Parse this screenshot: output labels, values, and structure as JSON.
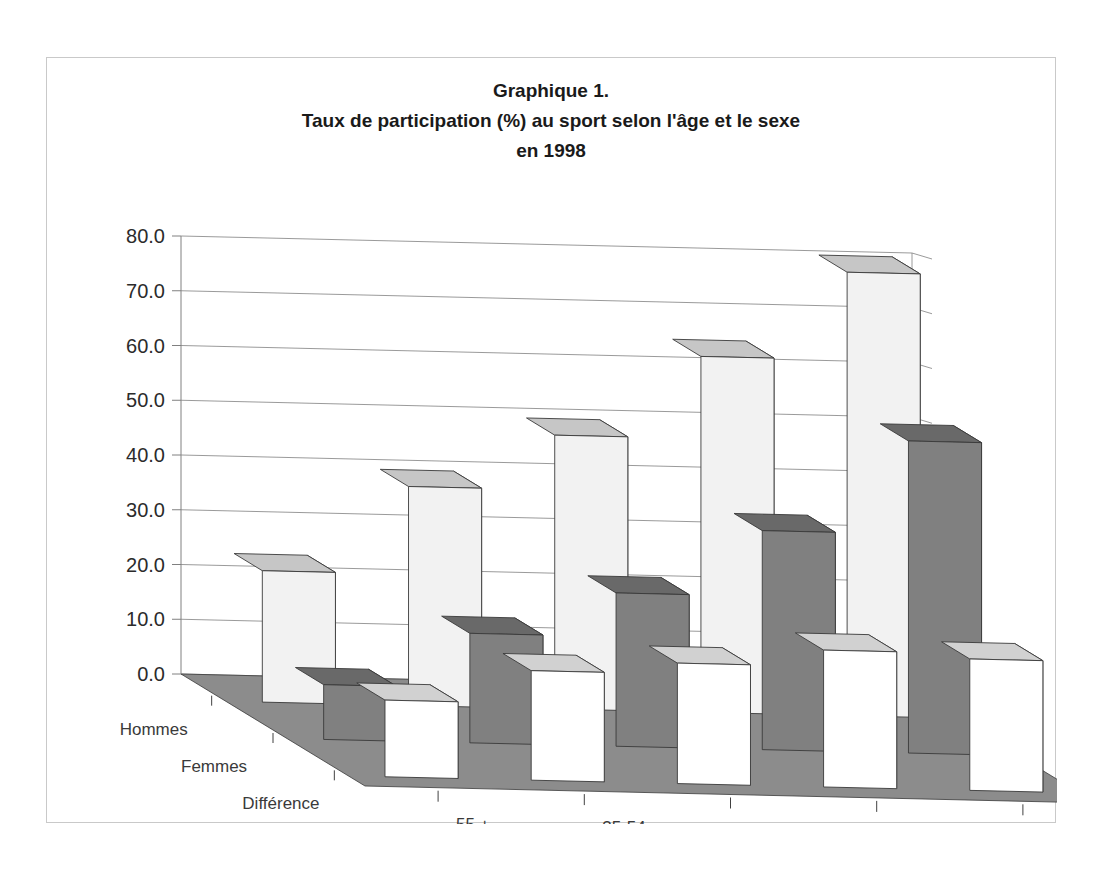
{
  "title": {
    "line1": "Graphique 1.",
    "line2": "Taux de participation (%) au sport selon l'âge et le sexe",
    "line3": "en 1998"
  },
  "colors": {
    "hommes": "#f2f2f2",
    "femmes": "#808080",
    "difference": "#ffffff",
    "floor": "#8c8c8c",
    "side_shade": "#9a9a9a",
    "outline": "#3a3a3a",
    "gridline": "#808080",
    "text": "#2b2b2b",
    "frame": "#c9c9c9"
  },
  "chart_data": {
    "type": "bar",
    "title": "Graphique 1. Taux de participation (%) au sport selon l'âge et le sexe en 1998",
    "xlabel": "âge",
    "ylabel": "",
    "ylim": [
      0,
      80
    ],
    "yticks": [
      "0.0",
      "10.0",
      "20.0",
      "30.0",
      "40.0",
      "50.0",
      "60.0",
      "70.0",
      "80.0"
    ],
    "ytick_values": [
      0,
      10,
      20,
      30,
      40,
      50,
      60,
      70,
      80
    ],
    "grid": true,
    "legend": "none",
    "projection": "3d",
    "depth_axis_label": "",
    "depth_categories": [
      "Hommes",
      "Femmes",
      "Différence"
    ],
    "categories": [
      "55 +",
      "35-54",
      "25-34",
      "19-24",
      "15-18"
    ],
    "series": [
      {
        "name": "Hommes",
        "values": [
          24.0,
          40.0,
          50.0,
          65.0,
          81.0
        ]
      },
      {
        "name": "Femmes",
        "values": [
          10.0,
          20.0,
          28.0,
          40.0,
          57.0
        ]
      },
      {
        "name": "Différence",
        "values": [
          14.0,
          20.0,
          22.0,
          25.0,
          24.0
        ]
      }
    ]
  }
}
